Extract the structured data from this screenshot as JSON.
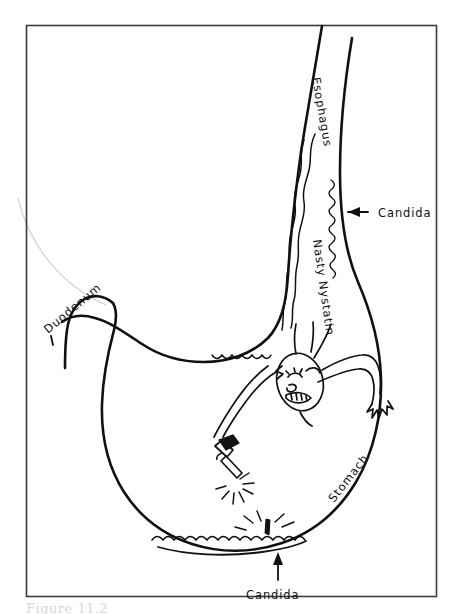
{
  "figure": {
    "caption": "Figure 11.2",
    "frame_color": "#3a3a3a",
    "ink_color": "#111111",
    "background_color": "#ffffff"
  },
  "labels": {
    "esophagus": "Esophagus",
    "candida_upper": "Candida",
    "nasty_nystatin": "Nasty Nystatin",
    "duodenum": "Duodenum",
    "stomach": "Stomach",
    "candida_lower": "Candida"
  },
  "annotations": {
    "arrow_upper": "arrow pointing left toward the esophageal Candida",
    "arrow_lower": "arrow pointing up toward the gastric Candida"
  },
  "icons": {
    "character": "nystatin-character-icon",
    "weapon": "spray-gun-icon",
    "upper_arrow": "arrow-left-icon",
    "lower_arrow": "arrow-up-icon"
  }
}
